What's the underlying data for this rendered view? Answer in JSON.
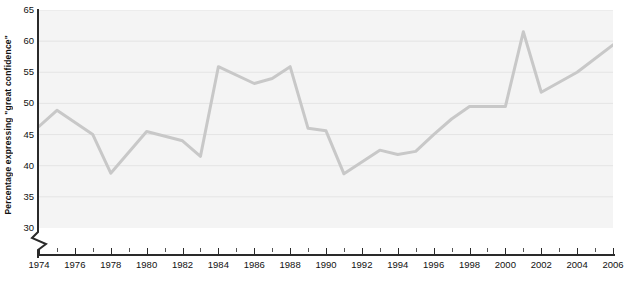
{
  "chart_data": {
    "type": "line",
    "title": "",
    "xlabel": "",
    "ylabel": "Percentage expressing \"great confidence\"",
    "xlim": [
      1974,
      2006
    ],
    "ylim": [
      30,
      65
    ],
    "ylim_note": "axis broken below 30",
    "y_ticks": [
      30,
      35,
      40,
      45,
      50,
      55,
      60,
      65
    ],
    "y_tick_labels": [
      "30",
      "35",
      "40",
      "45",
      "50",
      "55",
      "60",
      "65"
    ],
    "x_ticks_major": [
      1974,
      1976,
      1978,
      1980,
      1982,
      1984,
      1986,
      1988,
      1990,
      1992,
      1994,
      1996,
      1998,
      2000,
      2002,
      2004,
      2006
    ],
    "x_tick_labels": [
      "1974",
      "1976",
      "1978",
      "1980",
      "1982",
      "1984",
      "1986",
      "1988",
      "1990",
      "1992",
      "1994",
      "1996",
      "1998",
      "2000",
      "2002",
      "2004",
      "2006"
    ],
    "x_ticks_minor": [
      1975,
      1977,
      1979,
      1981,
      1983,
      1985,
      1987,
      1989,
      1991,
      1993,
      1995,
      1997,
      1999,
      2001,
      2003,
      2005
    ],
    "grid": "horizontal",
    "legend": "none",
    "series": [
      {
        "name": "Percentage expressing \"great confidence\"",
        "color": "#c8c8c8",
        "x": [
          1974,
          1975,
          1977,
          1978,
          1980,
          1982,
          1983,
          1984,
          1986,
          1987,
          1988,
          1989,
          1990,
          1991,
          1993,
          1994,
          1995,
          1996,
          1997,
          1998,
          2000,
          2001,
          2002,
          2004,
          2006
        ],
        "values": [
          46.3,
          48.9,
          45.0,
          38.8,
          45.5,
          44.0,
          41.5,
          55.9,
          53.2,
          54.0,
          55.9,
          46.0,
          45.6,
          38.7,
          42.5,
          41.8,
          42.3,
          45.0,
          47.5,
          49.5,
          49.5,
          61.5,
          51.8,
          55.0,
          59.4
        ]
      }
    ],
    "plot_background": "#f4f4f4",
    "gridline_color": "#e4e4e4",
    "axis_color": "#2a2a2a"
  },
  "axis": {
    "y_title": "Percentage expressing \"great confidence\"",
    "break_marker": "zigzag"
  }
}
